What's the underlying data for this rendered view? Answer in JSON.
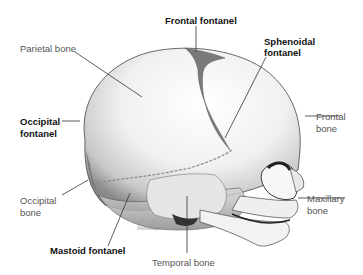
{
  "figure": {
    "labels": {
      "parietal_bone": "Parietal bone",
      "frontal_fontanel": "Frontal fontanel",
      "sphenoidal_fontanel_line1": "Sphenoidal",
      "sphenoidal_fontanel_line2": "fontanel",
      "frontal_bone_line1": "Frontal",
      "frontal_bone_line2": "bone",
      "occipital_fontanel_line1": "Occipital",
      "occipital_fontanel_line2": "fontanel",
      "occipital_bone_line1": "Occipital",
      "occipital_bone_line2": "bone",
      "maxillary_bone_line1": "Maxillary",
      "maxillary_bone_line2": "bone",
      "mastoid_fontanel": "Mastoid fontanel",
      "temporal_bone": "Temporal bone"
    },
    "signature": "Pennings",
    "colors": {
      "background": "#ffffff",
      "bold_label": "#111111",
      "regular_label": "#555555",
      "leader_line": "#333333",
      "skull_fill": "#f4f4f4",
      "skull_shade": "#9a9a9a"
    }
  }
}
